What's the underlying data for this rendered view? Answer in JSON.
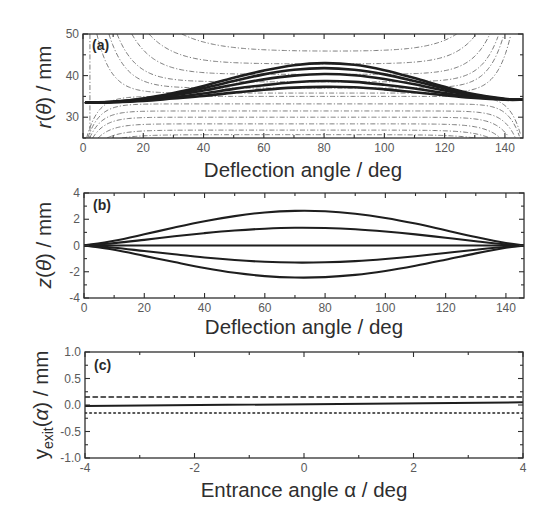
{
  "chart_data": [
    {
      "panel_label": "(a)",
      "type": "line",
      "title": "",
      "xlabel": "Deflection angle / deg",
      "ylabel": "r(θ) / mm",
      "ylabel_parts": [
        {
          "t": "r",
          "italic": true
        },
        {
          "t": "(",
          "italic": false
        },
        {
          "t": "θ",
          "italic": true
        },
        {
          "t": ") / mm",
          "italic": false
        }
      ],
      "xlim": [
        0,
        146
      ],
      "ylim": [
        25,
        50
      ],
      "xticks": [
        0,
        20,
        40,
        60,
        80,
        100,
        120,
        140
      ],
      "xtick_labels": [
        "0",
        "20",
        "40",
        "60",
        "80",
        "100",
        "120",
        "140"
      ],
      "xminor_step": 10,
      "yticks": [
        30,
        40,
        50
      ],
      "ytick_labels": [
        "30",
        "40",
        "50"
      ],
      "yminor_step": 5,
      "grid": false,
      "legend": "none",
      "x": [
        1,
        10,
        20,
        30,
        40,
        50,
        60,
        70,
        80,
        90,
        100,
        110,
        120,
        130,
        140,
        146
      ],
      "series": [
        {
          "name": "trajectory-1",
          "style": "solid",
          "values": [
            33.5,
            33.7,
            34.5,
            35.8,
            37.5,
            39.5,
            41.2,
            42.5,
            43.0,
            42.6,
            41.3,
            39.4,
            37.3,
            35.5,
            34.4,
            34.2
          ]
        },
        {
          "name": "trajectory-2",
          "style": "solid",
          "values": [
            33.5,
            33.7,
            34.4,
            35.5,
            37.0,
            38.7,
            40.3,
            41.4,
            41.8,
            41.4,
            40.3,
            38.7,
            36.9,
            35.3,
            34.3,
            34.2
          ]
        },
        {
          "name": "trajectory-3",
          "style": "solid",
          "values": [
            33.5,
            33.7,
            34.2,
            35.2,
            36.4,
            37.8,
            39.1,
            40.0,
            40.4,
            40.1,
            39.2,
            37.9,
            36.4,
            35.1,
            34.3,
            34.2
          ]
        },
        {
          "name": "trajectory-4",
          "style": "solid",
          "values": [
            33.5,
            33.6,
            34.1,
            34.8,
            35.7,
            36.8,
            37.7,
            38.4,
            38.7,
            38.5,
            37.8,
            36.9,
            35.8,
            34.8,
            34.3,
            34.2
          ]
        },
        {
          "name": "trajectory-5",
          "style": "solid",
          "values": [
            33.5,
            33.6,
            33.9,
            34.5,
            35.1,
            35.9,
            36.6,
            37.1,
            37.3,
            37.2,
            36.7,
            36.0,
            35.3,
            34.6,
            34.2,
            34.2
          ]
        }
      ],
      "field_contours": {
        "style": "dash-dot",
        "upper": [
          {
            "level": 45.8,
            "enter_deg": 32.8,
            "exit_deg": 124.0
          },
          {
            "level": 42.8,
            "enter_deg": 21.9,
            "exit_deg": 130.5
          },
          {
            "level": 40.3,
            "enter_deg": 16.2,
            "exit_deg": 135.0
          },
          {
            "level": 38.5,
            "enter_deg": 11.3,
            "exit_deg": 138.0
          },
          {
            "level": 37.0,
            "enter_deg": 8.6,
            "exit_deg": 139.7
          },
          {
            "level": 35.8,
            "enter_deg": 4.6,
            "exit_deg": 142.0
          }
        ],
        "lower": [
          {
            "level": 35.0,
            "enter_deg": 1.2,
            "exit_deg": 145.5
          },
          {
            "level": 33.2,
            "enter_deg": 1.6,
            "exit_deg": 145.0
          },
          {
            "level": 31.5,
            "enter_deg": 2.2,
            "exit_deg": 143.5
          },
          {
            "level": 30.0,
            "enter_deg": 3.2,
            "exit_deg": 141.5
          },
          {
            "level": 28.4,
            "enter_deg": 5.0,
            "exit_deg": 138.5
          },
          {
            "level": 26.9,
            "enter_deg": 8.0,
            "exit_deg": 135.0
          },
          {
            "level": 25.8,
            "enter_deg": 13.0,
            "exit_deg": 130.0
          }
        ],
        "vertical_deg": 2.3
      }
    },
    {
      "panel_label": "(b)",
      "type": "line",
      "title": "",
      "xlabel": "Deflection angle / deg",
      "ylabel": "z(θ) / mm",
      "ylabel_parts": [
        {
          "t": "z",
          "italic": true
        },
        {
          "t": "(",
          "italic": false
        },
        {
          "t": "θ",
          "italic": true
        },
        {
          "t": ") / mm",
          "italic": false
        }
      ],
      "xlim": [
        0,
        146
      ],
      "ylim": [
        -4,
        4
      ],
      "xticks": [
        0,
        20,
        40,
        60,
        80,
        100,
        120,
        140
      ],
      "xtick_labels": [
        "0",
        "20",
        "40",
        "60",
        "80",
        "100",
        "120",
        "140"
      ],
      "xminor_step": 10,
      "yticks": [
        -4,
        -2,
        0,
        2,
        4
      ],
      "ytick_labels": [
        "-4",
        "-2",
        "0",
        "2",
        "4"
      ],
      "yminor_step": 1,
      "grid": false,
      "legend": "none",
      "x": [
        0,
        10,
        20,
        30,
        40,
        50,
        60,
        70,
        80,
        90,
        100,
        110,
        120,
        130,
        140,
        146
      ],
      "series": [
        {
          "name": "trajectory-1",
          "style": "solid",
          "values": [
            0,
            0.36,
            0.85,
            1.37,
            1.85,
            2.24,
            2.52,
            2.64,
            2.61,
            2.42,
            2.1,
            1.67,
            1.16,
            0.65,
            0.19,
            0
          ]
        },
        {
          "name": "trajectory-2",
          "style": "solid",
          "values": [
            0,
            0.18,
            0.43,
            0.7,
            0.94,
            1.14,
            1.28,
            1.35,
            1.33,
            1.24,
            1.07,
            0.85,
            0.59,
            0.33,
            0.09,
            0
          ]
        },
        {
          "name": "trajectory-3",
          "style": "solid",
          "values": [
            0,
            0,
            0,
            0,
            0,
            0,
            0,
            0,
            0,
            0,
            0,
            0,
            0,
            0,
            0,
            0
          ]
        },
        {
          "name": "trajectory-4",
          "style": "solid",
          "values": [
            0,
            -0.17,
            -0.42,
            -0.67,
            -0.91,
            -1.1,
            -1.24,
            -1.3,
            -1.28,
            -1.19,
            -1.03,
            -0.82,
            -0.57,
            -0.32,
            -0.09,
            0
          ]
        },
        {
          "name": "trajectory-5",
          "style": "solid",
          "values": [
            0,
            -0.33,
            -0.79,
            -1.26,
            -1.71,
            -2.08,
            -2.33,
            -2.44,
            -2.41,
            -2.24,
            -1.94,
            -1.54,
            -1.08,
            -0.6,
            -0.17,
            0
          ]
        }
      ]
    },
    {
      "panel_label": "(c)",
      "type": "line",
      "title": "",
      "xlabel": "Entrance angle α / deg",
      "ylabel": "y_exit(α) / mm",
      "ylabel_parts": [
        {
          "t": "y",
          "italic": false
        },
        {
          "t": "exit",
          "italic": false,
          "sub": true
        },
        {
          "t": "(",
          "italic": false
        },
        {
          "t": "α",
          "italic": true
        },
        {
          "t": ") / mm",
          "italic": false
        }
      ],
      "xlim": [
        -4,
        4
      ],
      "ylim": [
        -1,
        1
      ],
      "xticks": [
        -4,
        -2,
        0,
        2,
        4
      ],
      "xtick_labels": [
        "-4",
        "-2",
        "0",
        "2",
        "4"
      ],
      "xminor_step": 1,
      "yticks": [
        -1,
        -0.5,
        0,
        0.5,
        1
      ],
      "ytick_labels": [
        "-1.0",
        "-0.5",
        "0.0",
        "0.5",
        "1.0"
      ],
      "yminor_step": 0.25,
      "grid": false,
      "legend": "none",
      "x": [
        -4,
        4
      ],
      "series": [
        {
          "name": "exit-position",
          "style": "solid",
          "values": [
            -0.02,
            0.05
          ]
        },
        {
          "name": "upper-bound",
          "style": "dashed",
          "values": [
            0.15,
            0.15
          ]
        },
        {
          "name": "lower-bound",
          "style": "dotted",
          "values": [
            -0.15,
            -0.15
          ]
        }
      ]
    }
  ]
}
